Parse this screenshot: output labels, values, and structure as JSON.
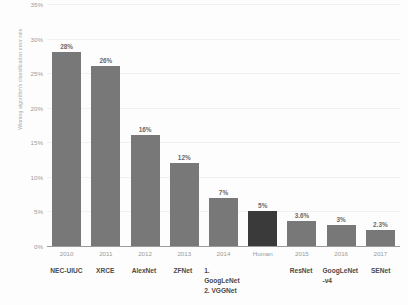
{
  "chart_data": {
    "type": "bar",
    "title": "",
    "xlabel": "",
    "ylabel": "Winning algorithm's classification error rate",
    "ylim": [
      0,
      35
    ],
    "ytick_labels": [
      "0%",
      "5%",
      "10%",
      "15%",
      "20%",
      "25%",
      "30%",
      "35%"
    ],
    "ytick_values": [
      0,
      5,
      10,
      15,
      20,
      25,
      30,
      35
    ],
    "grid": true,
    "legend": "none",
    "categories": [
      "2010",
      "2011",
      "2012",
      "2013",
      "2014",
      "Human",
      "2015",
      "2016",
      "2017"
    ],
    "values": [
      28,
      26,
      16,
      12,
      7,
      5,
      3.6,
      3,
      2.3
    ],
    "value_labels": [
      "28%",
      "26%",
      "16%",
      "12%",
      "7%",
      "5%",
      "3.6%",
      "3%",
      "2.3%"
    ],
    "secondary_labels": [
      {
        "line1": "NEC-UIUC",
        "line2": ""
      },
      {
        "line1": "XRCE",
        "line2": ""
      },
      {
        "line1": "AlexNet",
        "line2": ""
      },
      {
        "line1": "ZFNet",
        "line2": ""
      },
      {
        "line1": "1. GoogLeNet",
        "line2": "2. VGGNet"
      },
      {
        "line1": "",
        "line2": ""
      },
      {
        "line1": "ResNet",
        "line2": ""
      },
      {
        "line1": "GoogLeNet",
        "line2": "-v4"
      },
      {
        "line1": "SENet",
        "line2": ""
      }
    ],
    "bar_colors": [
      "#787878",
      "#787878",
      "#787878",
      "#787878",
      "#787878",
      "#3a3a3a",
      "#787878",
      "#787878",
      "#787878"
    ],
    "highlight_index": 5,
    "highlight_color": "#3a3a3a",
    "series_color": "#787878",
    "background_color": "#fdfdfd"
  }
}
